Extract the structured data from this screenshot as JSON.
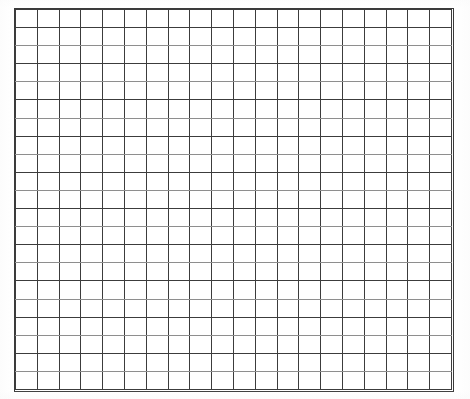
{
  "document": {
    "kind": "scanned-graph-paper",
    "page_background": "#ffffff",
    "top_text_remnant": "",
    "width_px": 470,
    "height_px": 399
  },
  "grid": {
    "label": "graph-paper-grid",
    "columns": 20,
    "rows": 21,
    "cell_width_px": 21.85,
    "cell_height_px": 18.14,
    "origin_x_px": 15,
    "origin_y_px": 9,
    "width_px": 437,
    "height_px": 381,
    "line_color_major": "#3c3c3c",
    "line_color_minor": "#8e8e8e",
    "line_width_px": 1,
    "light_rule_rows": [
      1,
      3,
      5,
      7,
      9,
      11,
      13,
      15,
      17,
      19
    ]
  },
  "chart_data": {
    "type": "table",
    "title": "",
    "xlabel": "",
    "ylabel": "",
    "columns": 20,
    "rows": 21,
    "grid": true,
    "values": [],
    "annotations": []
  }
}
